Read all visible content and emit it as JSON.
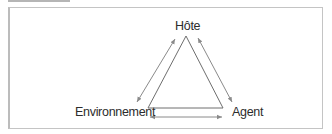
{
  "diagram": {
    "nodes": [
      {
        "id": "host",
        "label": "Hôte"
      },
      {
        "id": "agent",
        "label": "Agent"
      },
      {
        "id": "environment",
        "label": "Environnement"
      }
    ],
    "edges": [
      {
        "from": "host",
        "to": "environment",
        "type": "bidirectional"
      },
      {
        "from": "host",
        "to": "agent",
        "type": "bidirectional"
      },
      {
        "from": "environment",
        "to": "agent",
        "type": "bidirectional"
      }
    ],
    "shape": "triangle",
    "colors": {
      "line": "#6e6e6e",
      "arrow": "#8a8a8a",
      "text": "#2c2c2c",
      "frame": "#c4c4c4"
    }
  }
}
